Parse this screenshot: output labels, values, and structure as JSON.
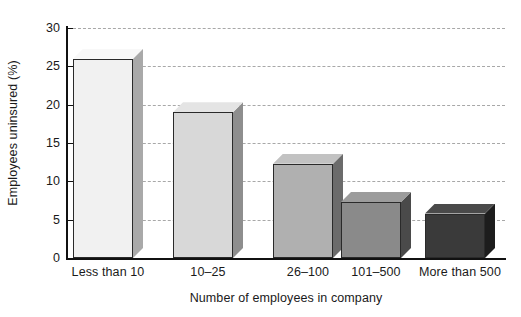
{
  "chart_data": {
    "type": "bar",
    "title": "",
    "subtitle": "",
    "xlabel": "Number of employees in company",
    "ylabel": "Employees uninsured (%)",
    "categories": [
      "Less than 10",
      "10–25",
      "26–100",
      "101–500",
      "More than 500"
    ],
    "values": [
      26.0,
      19.0,
      12.3,
      7.3,
      5.8
    ],
    "series": [
      {
        "name": "Employees uninsured (%)",
        "values": [
          26.0,
          19.0,
          12.3,
          7.3,
          5.8
        ]
      }
    ],
    "ylim": [
      0,
      30
    ],
    "yticks": [
      0,
      5,
      10,
      15,
      20,
      25,
      30
    ],
    "ytick_labels": [
      "0",
      "5",
      "10",
      "15",
      "20",
      "25",
      "30"
    ],
    "xlim_note": "categorical",
    "grid": "horizontal-dashed",
    "legend": "none",
    "legend_position": "none",
    "style": "3d-shaded-bars",
    "bar_colors": [
      "#f1f1f1",
      "#d8d8d8",
      "#b0b0b0",
      "#8a8a8a",
      "#3a3a3a"
    ],
    "bar_side_colors": [
      "#a9a9a9",
      "#8e8e8e",
      "#6b6b6b",
      "#4a4a4a",
      "#1d1d1d"
    ],
    "bar_top_colors": [
      "#f8f8f8",
      "#e4e4e4",
      "#c2c2c2",
      "#9c9c9c",
      "#4a4a4a"
    ],
    "axis_color": "#111111",
    "grid_color": "#a8a8a8",
    "background_color": "#ffffff",
    "text_color": "#1a1a1a"
  }
}
